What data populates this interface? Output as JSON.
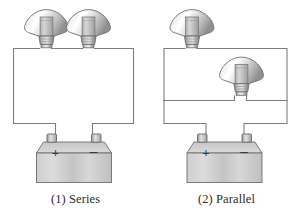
{
  "figure": {
    "title": "",
    "background": "#ffffff",
    "width": 302,
    "height": 214
  },
  "colors": {
    "wire": "#7d7d7d",
    "outline": "#6e6e6e",
    "battery_body_light": "#d8d8d8",
    "battery_body_dark": "#b4b4b4",
    "battery_top": "#c2c2c2",
    "bulb_glass_light": "#ffffff",
    "bulb_glass_mid": "#d9d9d9",
    "bulb_glass_dark": "#9a9a9a",
    "bulb_base": "#a8a8a8",
    "terminal": "#c9c9c9",
    "text": "#2b2b2b"
  },
  "panels": [
    {
      "id": "series",
      "caption": "(1) Series",
      "circuit_type": "series",
      "bulb_count": 2,
      "battery": {
        "plus_label": "+",
        "minus_label": "–",
        "terminal_count": 2
      },
      "bulbs": [
        {
          "id": "series-bulb-1",
          "label": ""
        },
        {
          "id": "series-bulb-2",
          "label": ""
        }
      ]
    },
    {
      "id": "parallel",
      "caption": "(2) Parallel",
      "circuit_type": "parallel",
      "bulb_count": 2,
      "battery": {
        "plus_label": "+",
        "minus_label": "–",
        "terminal_count": 2
      },
      "bulbs": [
        {
          "id": "parallel-bulb-1",
          "label": ""
        },
        {
          "id": "parallel-bulb-2",
          "label": ""
        }
      ]
    }
  ]
}
